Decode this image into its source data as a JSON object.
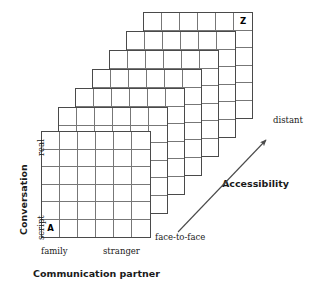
{
  "diagram": {
    "title_hidden": "",
    "planes": {
      "count": 7,
      "rows": 6,
      "cols": 6,
      "front_marker": "A",
      "back_marker": "Z"
    },
    "axes": {
      "y": {
        "title": "Conversation",
        "high_label": "real",
        "low_label": "script"
      },
      "x": {
        "title": "Communication partner",
        "left_label": "family",
        "right_label": "stranger"
      },
      "z": {
        "title": "Accessibility",
        "near_label": "face-to-face",
        "far_label": "distant"
      }
    },
    "colors": {
      "plane_border": "#4a4a4a",
      "cell_line": "#777777",
      "text": "#1a1a1a",
      "arrow": "#4a4a4a",
      "background": "#ffffff"
    }
  }
}
